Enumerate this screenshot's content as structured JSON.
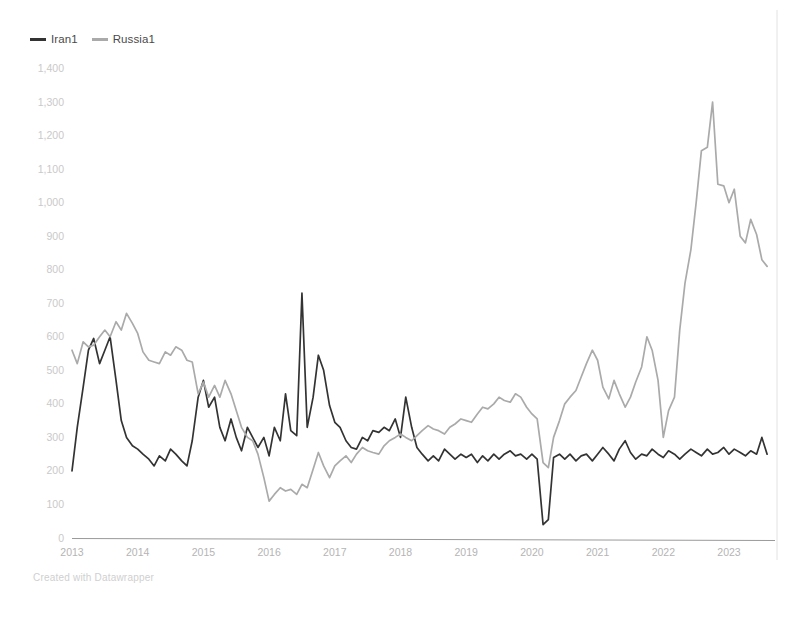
{
  "legend": {
    "position": "top-left",
    "entries": [
      {
        "label": "Iran1",
        "color": "#333333",
        "name": "iran1"
      },
      {
        "label": "Russia1",
        "color": "#aaaaaa",
        "name": "russia1"
      }
    ]
  },
  "footer": {
    "credit": "Created with Datawrapper"
  },
  "axes": {
    "y_ticks": [
      "0",
      "100",
      "200",
      "300",
      "400",
      "500",
      "600",
      "700",
      "800",
      "900",
      "1,000",
      "1,100",
      "1,200",
      "1,300",
      "1,400"
    ],
    "x_ticks": [
      "2013",
      "2014",
      "2015",
      "2016",
      "2017",
      "2018",
      "2019",
      "2020",
      "2021",
      "2022",
      "2023"
    ]
  },
  "colors": {
    "iran": "#333333",
    "russia": "#aaaaaa",
    "axis": "#9a9a9a",
    "ytick_text": "#c9c9c9",
    "xtick_text": "#b4b4b4",
    "background": "#ffffff"
  },
  "chart_data": {
    "type": "line",
    "title": "",
    "subtitle": "",
    "xlabel": "",
    "ylabel": "",
    "xlim": [
      2013.0,
      2023.7
    ],
    "ylim": [
      0,
      1400
    ],
    "grid": false,
    "legend_position": "top-left",
    "x_tick_values": [
      2013,
      2014,
      2015,
      2016,
      2017,
      2018,
      2019,
      2020,
      2021,
      2022,
      2023
    ],
    "y_tick_values": [
      0,
      100,
      200,
      300,
      400,
      500,
      600,
      700,
      800,
      900,
      1000,
      1100,
      1200,
      1300,
      1400
    ],
    "x_unit": "month",
    "series": [
      {
        "name": "Iran1",
        "color": "#333333",
        "x": [
          2013.0,
          2013.08,
          2013.17,
          2013.25,
          2013.33,
          2013.42,
          2013.5,
          2013.58,
          2013.67,
          2013.75,
          2013.83,
          2013.92,
          2014.0,
          2014.08,
          2014.17,
          2014.25,
          2014.33,
          2014.42,
          2014.5,
          2014.58,
          2014.67,
          2014.75,
          2014.83,
          2014.92,
          2015.0,
          2015.08,
          2015.17,
          2015.25,
          2015.33,
          2015.42,
          2015.5,
          2015.58,
          2015.67,
          2015.75,
          2015.83,
          2015.92,
          2016.0,
          2016.08,
          2016.17,
          2016.25,
          2016.33,
          2016.42,
          2016.5,
          2016.58,
          2016.67,
          2016.75,
          2016.83,
          2016.92,
          2017.0,
          2017.08,
          2017.17,
          2017.25,
          2017.33,
          2017.42,
          2017.5,
          2017.58,
          2017.67,
          2017.75,
          2017.83,
          2017.92,
          2018.0,
          2018.08,
          2018.17,
          2018.25,
          2018.33,
          2018.42,
          2018.5,
          2018.58,
          2018.67,
          2018.75,
          2018.83,
          2018.92,
          2019.0,
          2019.08,
          2019.17,
          2019.25,
          2019.33,
          2019.42,
          2019.5,
          2019.58,
          2019.67,
          2019.75,
          2019.83,
          2019.92,
          2020.0,
          2020.08,
          2020.17,
          2020.25,
          2020.33,
          2020.42,
          2020.5,
          2020.58,
          2020.67,
          2020.75,
          2020.83,
          2020.92,
          2021.0,
          2021.08,
          2021.17,
          2021.25,
          2021.33,
          2021.42,
          2021.5,
          2021.58,
          2021.67,
          2021.75,
          2021.83,
          2021.92,
          2022.0,
          2022.08,
          2022.17,
          2022.25,
          2022.33,
          2022.42,
          2022.5,
          2022.58,
          2022.67,
          2022.75,
          2022.83,
          2022.92,
          2023.0,
          2023.08,
          2023.17,
          2023.25,
          2023.33,
          2023.42,
          2023.5,
          2023.58
        ],
        "values": [
          200,
          330,
          450,
          560,
          595,
          520,
          560,
          600,
          470,
          350,
          300,
          275,
          265,
          250,
          235,
          215,
          245,
          230,
          265,
          250,
          230,
          215,
          290,
          420,
          470,
          390,
          420,
          330,
          290,
          355,
          300,
          260,
          330,
          300,
          270,
          300,
          245,
          330,
          290,
          430,
          320,
          305,
          730,
          330,
          420,
          545,
          500,
          395,
          345,
          330,
          290,
          270,
          265,
          300,
          290,
          320,
          315,
          330,
          320,
          355,
          300,
          420,
          330,
          270,
          250,
          230,
          245,
          230,
          265,
          250,
          235,
          250,
          240,
          250,
          225,
          245,
          230,
          250,
          235,
          250,
          260,
          245,
          250,
          235,
          250,
          235,
          40,
          55,
          240,
          250,
          235,
          250,
          230,
          245,
          250,
          230,
          250,
          270,
          250,
          230,
          265,
          290,
          255,
          235,
          250,
          245,
          265,
          250,
          240,
          260,
          250,
          235,
          250,
          265,
          255,
          245,
          265,
          250,
          255,
          270,
          250,
          265,
          255,
          245,
          260,
          250,
          300,
          250
        ]
      },
      {
        "name": "Russia1",
        "color": "#aaaaaa",
        "x": [
          2013.0,
          2013.08,
          2013.17,
          2013.25,
          2013.33,
          2013.42,
          2013.5,
          2013.58,
          2013.67,
          2013.75,
          2013.83,
          2013.92,
          2014.0,
          2014.08,
          2014.17,
          2014.25,
          2014.33,
          2014.42,
          2014.5,
          2014.58,
          2014.67,
          2014.75,
          2014.83,
          2014.92,
          2015.0,
          2015.08,
          2015.17,
          2015.25,
          2015.33,
          2015.42,
          2015.5,
          2015.58,
          2015.67,
          2015.75,
          2015.83,
          2015.92,
          2016.0,
          2016.08,
          2016.17,
          2016.25,
          2016.33,
          2016.42,
          2016.5,
          2016.58,
          2016.67,
          2016.75,
          2016.83,
          2016.92,
          2017.0,
          2017.08,
          2017.17,
          2017.25,
          2017.33,
          2017.42,
          2017.5,
          2017.58,
          2017.67,
          2017.75,
          2017.83,
          2017.92,
          2018.0,
          2018.08,
          2018.17,
          2018.25,
          2018.33,
          2018.42,
          2018.5,
          2018.58,
          2018.67,
          2018.75,
          2018.83,
          2018.92,
          2019.0,
          2019.08,
          2019.17,
          2019.25,
          2019.33,
          2019.42,
          2019.5,
          2019.58,
          2019.67,
          2019.75,
          2019.83,
          2019.92,
          2020.0,
          2020.08,
          2020.17,
          2020.25,
          2020.33,
          2020.42,
          2020.5,
          2020.58,
          2020.67,
          2020.75,
          2020.83,
          2020.92,
          2021.0,
          2021.08,
          2021.17,
          2021.25,
          2021.33,
          2021.42,
          2021.5,
          2021.58,
          2021.67,
          2021.75,
          2021.83,
          2021.92,
          2022.0,
          2022.08,
          2022.17,
          2022.25,
          2022.33,
          2022.42,
          2022.5,
          2022.58,
          2022.67,
          2022.75,
          2022.83,
          2022.92,
          2023.0,
          2023.08,
          2023.17,
          2023.25,
          2023.33,
          2023.42,
          2023.5,
          2023.58
        ],
        "values": [
          560,
          520,
          585,
          570,
          575,
          600,
          620,
          600,
          645,
          620,
          670,
          640,
          610,
          555,
          530,
          525,
          520,
          555,
          545,
          570,
          560,
          530,
          525,
          430,
          465,
          420,
          455,
          420,
          470,
          430,
          380,
          330,
          300,
          290,
          250,
          180,
          110,
          130,
          150,
          140,
          145,
          130,
          160,
          150,
          205,
          255,
          215,
          180,
          215,
          230,
          245,
          225,
          250,
          270,
          260,
          255,
          250,
          275,
          290,
          300,
          310,
          300,
          290,
          305,
          320,
          335,
          325,
          320,
          310,
          330,
          340,
          355,
          350,
          345,
          370,
          390,
          385,
          400,
          420,
          410,
          405,
          430,
          420,
          390,
          370,
          355,
          225,
          210,
          300,
          350,
          400,
          420,
          440,
          480,
          520,
          560,
          530,
          450,
          415,
          470,
          430,
          390,
          420,
          465,
          510,
          600,
          560,
          470,
          300,
          380,
          420,
          620,
          760,
          860,
          1000,
          1155,
          1165,
          1300,
          1055,
          1050,
          1000,
          1040,
          900,
          880,
          950,
          905,
          830,
          810
        ]
      }
    ]
  }
}
